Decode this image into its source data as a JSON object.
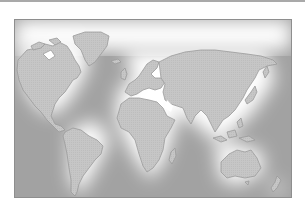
{
  "figure": {
    "type": "world-map-illustration",
    "style": "grayscale relief with glowing coastlines",
    "colors": {
      "background": "#ffffff",
      "land": "#c8c8c8",
      "land_edge": "#9a9a9a",
      "ocean_deep": "#9b9b9b",
      "ocean_glow": "#ffffff",
      "frame": "#8e8e8e",
      "top_rule": "#a9a9a9"
    },
    "continents": [
      "North America",
      "Greenland",
      "South America",
      "Europe",
      "Africa",
      "Asia",
      "Australia",
      "New Zealand",
      "Madagascar",
      "Indonesia",
      "Japan",
      "United Kingdom"
    ]
  }
}
